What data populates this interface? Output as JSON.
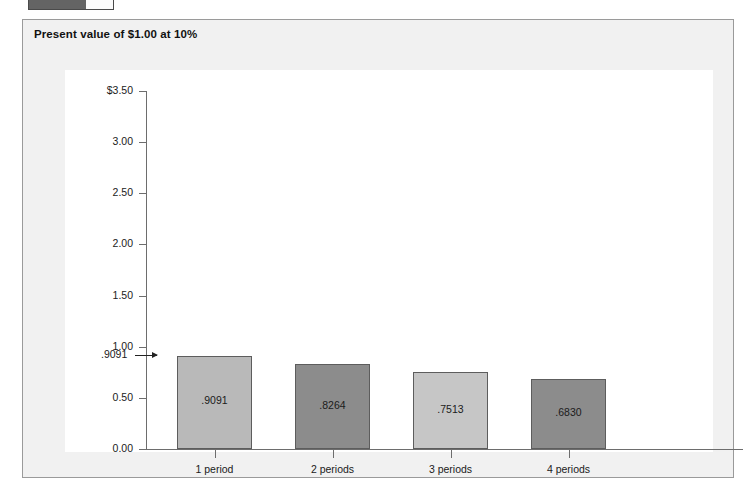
{
  "top_widget": {
    "name": "progress-bar",
    "fill_percent": 68,
    "fill_color": "#646464"
  },
  "panel": {
    "title": "Present value of $1.00 at 10%",
    "background": "#f1f1f1",
    "border_color": "#9a9a9a"
  },
  "chart_data": {
    "type": "bar",
    "title": "Present value of $1.00 at 10%",
    "xlabel": "",
    "ylabel": "",
    "categories": [
      "1 period",
      "2 periods",
      "3 periods",
      "4 periods"
    ],
    "values": [
      0.9091,
      0.8264,
      0.7513,
      0.683
    ],
    "bar_labels": [
      ".9091",
      ".8264",
      ".7513",
      ".6830"
    ],
    "bar_colors": [
      "#b9b9b9",
      "#8c8c8c",
      "#c6c6c6",
      "#8c8c8c"
    ],
    "ylim": [
      0.0,
      3.5
    ],
    "ytick_values": [
      3.5,
      3.0,
      2.5,
      2.0,
      1.5,
      1.0,
      0.5,
      0.0
    ],
    "ytick_labels": [
      "$3.50",
      "3.00",
      "2.50",
      "2.00",
      "1.50",
      "1.00",
      "0.50",
      "0.00"
    ],
    "grid": false,
    "legend": "none",
    "annotation": {
      "label": ".9091",
      "points_to": "1 period",
      "arrow": "right-arrow-icon"
    }
  }
}
